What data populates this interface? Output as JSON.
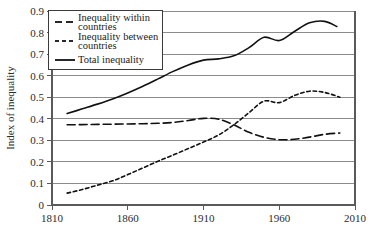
{
  "chart_data": {
    "type": "line",
    "title": "",
    "xlabel": "",
    "ylabel": "Index of inequality",
    "xlim": [
      1810,
      2010
    ],
    "ylim": [
      0,
      0.9
    ],
    "xticks": [
      1810,
      1860,
      1910,
      1960,
      2010
    ],
    "xtick_labels": [
      "1810",
      "1860",
      "1910",
      "1960",
      "2010"
    ],
    "yticks": [
      0,
      0.1,
      0.2,
      0.3,
      0.4,
      0.5,
      0.6,
      0.7,
      0.8,
      0.9
    ],
    "ytick_labels": [
      "0",
      "0.1",
      "0.2",
      "0.3",
      "0.4",
      "0.5",
      "0.6",
      "0.7",
      "0.8",
      "0.9"
    ],
    "grid": true,
    "grid_axis": "y",
    "legend_position": "top-left",
    "series": [
      {
        "name": "Inequality within countries",
        "style": "long-dash",
        "color": "#111111",
        "x": [
          1820,
          1830,
          1840,
          1850,
          1860,
          1870,
          1880,
          1890,
          1900,
          1910,
          1920,
          1930,
          1940,
          1950,
          1960,
          1970,
          1980,
          1990,
          2000
        ],
        "values": [
          0.372,
          0.373,
          0.374,
          0.375,
          0.376,
          0.377,
          0.379,
          0.383,
          0.392,
          0.402,
          0.398,
          0.372,
          0.337,
          0.314,
          0.303,
          0.305,
          0.315,
          0.328,
          0.334
        ]
      },
      {
        "name": "Inequality between countries",
        "style": "short-dash",
        "color": "#111111",
        "x": [
          1820,
          1830,
          1840,
          1850,
          1860,
          1870,
          1880,
          1890,
          1900,
          1910,
          1920,
          1930,
          1940,
          1950,
          1960,
          1970,
          1980,
          1990,
          2000
        ],
        "values": [
          0.055,
          0.072,
          0.092,
          0.112,
          0.141,
          0.172,
          0.203,
          0.232,
          0.262,
          0.292,
          0.325,
          0.372,
          0.428,
          0.482,
          0.475,
          0.508,
          0.528,
          0.522,
          0.5
        ]
      },
      {
        "name": "Total inequality",
        "style": "solid",
        "color": "#111111",
        "x": [
          1820,
          1830,
          1840,
          1850,
          1860,
          1870,
          1880,
          1890,
          1900,
          1910,
          1920,
          1930,
          1940,
          1950,
          1960,
          1970,
          1980,
          1990,
          1998
        ],
        "values": [
          0.424,
          0.446,
          0.468,
          0.492,
          0.52,
          0.551,
          0.585,
          0.62,
          0.65,
          0.672,
          0.678,
          0.692,
          0.73,
          0.778,
          0.763,
          0.805,
          0.845,
          0.852,
          0.828
        ]
      }
    ]
  },
  "legend": {
    "items": [
      {
        "label_line1": "Inequality within",
        "label_line2": "countries",
        "style": "long-dash"
      },
      {
        "label_line1": "Inequality between",
        "label_line2": "countries",
        "style": "short-dash"
      },
      {
        "label_line1": "Total inequality",
        "label_line2": "",
        "style": "solid"
      }
    ]
  }
}
